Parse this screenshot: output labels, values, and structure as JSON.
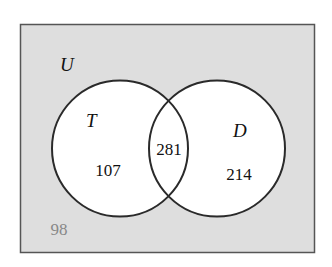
{
  "diagram": {
    "type": "venn",
    "universe": {
      "label": "U",
      "outside_count": "98"
    },
    "sets": [
      {
        "label": "T",
        "only_count": "107"
      },
      {
        "label": "D",
        "only_count": "214"
      }
    ],
    "intersection": {
      "count": "281"
    },
    "colors": {
      "universe_fill": "#dedede",
      "circle_fill": "#ffffff",
      "stroke": "#2a2a2a",
      "text": "#111111",
      "outside_text": "#888888"
    }
  }
}
